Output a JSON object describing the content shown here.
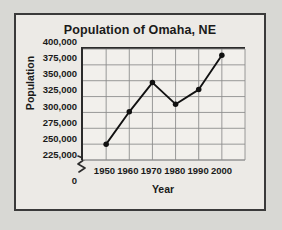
{
  "figure": {
    "title": "Population of Omaha, NE",
    "border_color": "#3a3a3a",
    "background_color": "#eceae6",
    "page_background": "#d8d8d4"
  },
  "axes": {
    "y_title": "Population",
    "x_title": "Year",
    "axis_break_symbol": "zigzag",
    "zero_label": "0",
    "line_color": "#2b2b2b",
    "grid_color": "#8d8d8d"
  },
  "chart_data": {
    "type": "line",
    "title": "Population of Omaha, NE",
    "xlabel": "Year",
    "ylabel": "Population",
    "x": [
      1950,
      1960,
      1970,
      1980,
      1990,
      2000
    ],
    "values": [
      250000,
      301000,
      347000,
      313000,
      336000,
      390000
    ],
    "x_tick_labels": [
      "1950",
      "1960",
      "1970",
      "1980",
      "1990",
      "2000"
    ],
    "y_tick_labels": [
      "400,000",
      "375,000",
      "350,000",
      "325,000",
      "300,000",
      "275,000",
      "250,000",
      "225,000"
    ],
    "y_tick_values": [
      400000,
      375000,
      350000,
      325000,
      300000,
      275000,
      250000,
      225000
    ],
    "ylim": [
      225000,
      400000
    ],
    "xlim": [
      1940,
      2010
    ],
    "axis_break": true,
    "grid": true,
    "legend": "none",
    "marker": "filled-circle",
    "marker_color": "#111111",
    "line_color": "#111111"
  }
}
